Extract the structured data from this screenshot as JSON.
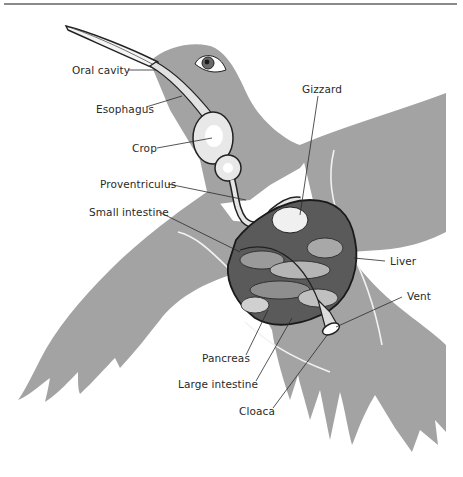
{
  "figure": {
    "colors": {
      "silhouette": "#a3a3a3",
      "organ_fill": "#d9d9d9",
      "organ_dark": "#3a3a3a",
      "leader_line": "#2a2a2a",
      "rule": "#8a8a8a"
    },
    "labels": [
      {
        "id": "oral-cavity",
        "text": "Oral cavity"
      },
      {
        "id": "esophagus",
        "text": "Esophagus"
      },
      {
        "id": "crop",
        "text": "Crop"
      },
      {
        "id": "gizzard",
        "text": "Gizzard"
      },
      {
        "id": "proventriculus",
        "text": "Proventriculus"
      },
      {
        "id": "small-intestine",
        "text": "Small intestine"
      },
      {
        "id": "liver",
        "text": "Liver"
      },
      {
        "id": "vent",
        "text": "Vent"
      },
      {
        "id": "pancreas",
        "text": "Pancreas"
      },
      {
        "id": "large-intestine",
        "text": "Large intestine"
      },
      {
        "id": "cloaca",
        "text": "Cloaca"
      }
    ]
  }
}
